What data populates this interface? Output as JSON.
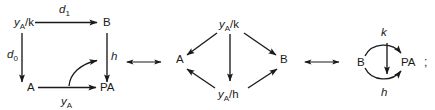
{
  "figure": {
    "type": "commutative-diagram",
    "separators": [
      {
        "symbol": "⟷",
        "name": "double-headed-arrow"
      },
      {
        "symbol": "⟷",
        "name": "double-headed-arrow"
      }
    ],
    "trailing_punctuation": ";"
  },
  "diagram1": {
    "name": "square-diagram",
    "nodes": {
      "top_left": {
        "text": "y",
        "sub": "A",
        "suffix": "/k"
      },
      "top_right": {
        "text": "B"
      },
      "bottom_left": {
        "text": "A"
      },
      "bottom_right": {
        "text": "PA"
      }
    },
    "edges": {
      "top": {
        "label": "d",
        "sub": "1",
        "from": "top_left",
        "to": "top_right",
        "dir": "right"
      },
      "left": {
        "label": "d",
        "sub": "0",
        "from": "top_left",
        "to": "bottom_left",
        "dir": "down"
      },
      "right": {
        "label": "h",
        "sub": "",
        "from": "top_right",
        "to": "bottom_right",
        "dir": "down"
      },
      "bottom": {
        "label": "y",
        "sub": "A",
        "from": "bottom_left",
        "to": "bottom_right",
        "dir": "right"
      },
      "curved": {
        "label": "",
        "sub": "",
        "from": "bottom",
        "to": "h",
        "dir": "curve-up-right"
      }
    }
  },
  "diagram2": {
    "name": "diamond-diagram",
    "nodes": {
      "top": {
        "text": "y",
        "sub": "A",
        "suffix": "/k"
      },
      "left": {
        "text": "A"
      },
      "right": {
        "text": "B"
      },
      "bottom": {
        "text": "y",
        "sub": "A",
        "suffix": "/h"
      }
    },
    "edges": [
      {
        "from": "top",
        "to": "left",
        "dir": "down-left"
      },
      {
        "from": "top",
        "to": "right",
        "dir": "down-right"
      },
      {
        "from": "top",
        "to": "bottom",
        "dir": "down"
      },
      {
        "from": "bottom",
        "to": "left",
        "dir": "up-left"
      },
      {
        "from": "bottom",
        "to": "right",
        "dir": "up-right"
      }
    ]
  },
  "diagram3": {
    "name": "parallel-arrows-diagram",
    "nodes": {
      "left": {
        "text": "B"
      },
      "right": {
        "text": "PA"
      }
    },
    "edges": [
      {
        "label": "k",
        "from": "left",
        "to": "right",
        "dir": "curve-over",
        "name": "upper-curved-arrow"
      },
      {
        "label": "h",
        "from": "left",
        "to": "right",
        "dir": "curve-under",
        "name": "lower-curved-arrow"
      },
      {
        "label": "",
        "from": "k",
        "to": "h",
        "dir": "down",
        "name": "natural-transformation-arrow"
      }
    ]
  }
}
